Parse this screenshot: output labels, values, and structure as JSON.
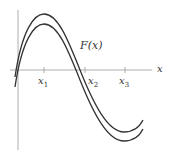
{
  "diagram": {
    "curve_label": "F(x)",
    "axis_label": "x",
    "ticks": [
      {
        "name": "x",
        "sub": "1"
      },
      {
        "name": "x",
        "sub": "2"
      },
      {
        "name": "x",
        "sub": "3"
      }
    ],
    "colors": {
      "line": "#333333",
      "axis": "#888888"
    }
  }
}
